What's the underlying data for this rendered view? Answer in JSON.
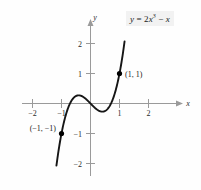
{
  "figure": {
    "caption_equation_plain": "y = 2x^3 - x",
    "background_color": "#fefefe",
    "curve_color": "#161616",
    "axis_color": "#9a9a9a",
    "point_color": "#000000",
    "equation_box_bg": "#f2f2f2"
  },
  "equation_label": {
    "lhs": "y",
    "equals": "=",
    "coefficient": "2",
    "variable": "x",
    "exponent": "3",
    "minus": "−",
    "trailing_variable": "x"
  },
  "axes": {
    "x_label": "x",
    "y_label": "y",
    "x_ticks": [
      "−2",
      "−1",
      "1",
      "2"
    ],
    "y_ticks": [
      "2",
      "1",
      "−1",
      "−2"
    ]
  },
  "annotations": [
    {
      "label": "(1, 1)",
      "x": 1,
      "y": 1
    },
    {
      "label": "(−1, −1)",
      "x": -1,
      "y": -1
    }
  ],
  "chart_data": {
    "type": "line",
    "title": "",
    "subtitle": "",
    "xlabel": "x",
    "ylabel": "y",
    "equation": "y = 2x^3 - x",
    "grid": false,
    "legend": null,
    "xlim": [
      -2.6,
      2.6
    ],
    "ylim": [
      -2.6,
      2.6
    ],
    "xticks": [
      -2,
      -1,
      1,
      2
    ],
    "xticklabels": [
      "−2",
      "−1",
      "1",
      "2"
    ],
    "yticks": [
      2,
      1,
      -1,
      -2
    ],
    "yticklabels": [
      "2",
      "1",
      "−1",
      "−2"
    ],
    "series": [
      {
        "name": "y = 2x^3 - x",
        "x": [
          -1.16,
          -1.1,
          -1.0,
          -0.9,
          -0.8,
          -0.7,
          -0.6,
          -0.5,
          -0.41,
          -0.3,
          -0.2,
          -0.1,
          0.0,
          0.1,
          0.2,
          0.3,
          0.41,
          0.5,
          0.6,
          0.7,
          0.8,
          0.9,
          1.0,
          1.1,
          1.16
        ],
        "y": [
          -1.96,
          -1.56,
          -1.0,
          -0.56,
          -0.22,
          0.01,
          0.17,
          0.25,
          0.27,
          0.25,
          0.18,
          0.1,
          0.0,
          -0.1,
          -0.18,
          -0.25,
          -0.27,
          -0.25,
          -0.17,
          -0.01,
          0.22,
          0.56,
          1.0,
          1.56,
          1.96
        ]
      }
    ],
    "points": [
      {
        "label": "(1, 1)",
        "x": 1,
        "y": 1
      },
      {
        "label": "(−1, −1)",
        "x": -1,
        "y": -1
      }
    ],
    "local_max": {
      "x": -0.408,
      "y": 0.272
    },
    "local_min": {
      "x": 0.408,
      "y": -0.272
    },
    "x_intercepts": [
      -0.707,
      0,
      0.707
    ]
  }
}
